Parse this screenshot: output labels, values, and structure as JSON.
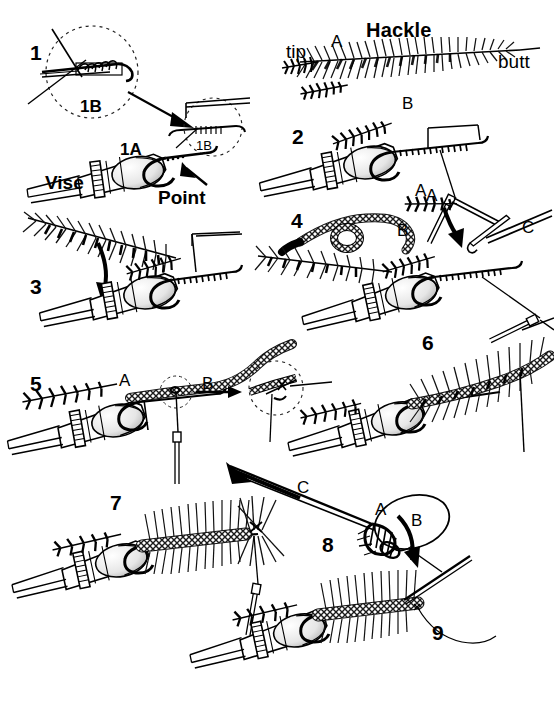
{
  "plate": {
    "title": "Fly Tying Sequence Plate",
    "width": 554,
    "height": 706,
    "background_color": "#ffffff",
    "ink_color": "#000000",
    "style": "pen-and-ink line illustration"
  },
  "steps": [
    {
      "id": "step-1",
      "number": "1",
      "x": 30,
      "y": 42
    },
    {
      "id": "step-2",
      "number": "2",
      "x": 292,
      "y": 126
    },
    {
      "id": "step-3",
      "number": "3",
      "x": 30,
      "y": 276
    },
    {
      "id": "step-4",
      "number": "4",
      "x": 291,
      "y": 210
    },
    {
      "id": "step-5",
      "number": "5",
      "x": 30,
      "y": 373
    },
    {
      "id": "step-6",
      "number": "6",
      "x": 422,
      "y": 332
    },
    {
      "id": "step-7",
      "number": "7",
      "x": 110,
      "y": 492
    },
    {
      "id": "step-8",
      "number": "8",
      "x": 322,
      "y": 534
    },
    {
      "id": "step-9",
      "number": "9",
      "x": 432,
      "y": 622
    }
  ],
  "annotations": {
    "hackle_title": {
      "text": "Hackle",
      "x": 366,
      "y": 20
    },
    "hackle_tip": {
      "text": "tip",
      "x": 286,
      "y": 42
    },
    "hackle_butt": {
      "text": "butt",
      "x": 498,
      "y": 52
    },
    "vise": {
      "text": "Vise",
      "x": 45,
      "y": 173
    },
    "point": {
      "text": "Point",
      "x": 158,
      "y": 188
    }
  },
  "sub_labels": [
    {
      "id": "label-1b-detail",
      "text": "1B",
      "x": 80,
      "y": 98,
      "kind": "step-sub"
    },
    {
      "id": "label-1a",
      "text": "1A",
      "x": 120,
      "y": 141,
      "kind": "step-sub"
    },
    {
      "id": "label-1b-inset",
      "text": "1B",
      "x": 196,
      "y": 139,
      "kind": "step-sub"
    },
    {
      "id": "label-hackle-a",
      "text": "A",
      "x": 331,
      "y": 33,
      "kind": "letter"
    },
    {
      "id": "label-2b",
      "text": "B",
      "x": 402,
      "y": 95,
      "kind": "letter"
    },
    {
      "id": "label-2a",
      "text": "A",
      "x": 415,
      "y": 182,
      "kind": "letter"
    },
    {
      "id": "label-4a",
      "text": "A",
      "x": 426,
      "y": 187,
      "kind": "letter"
    },
    {
      "id": "label-4b",
      "text": "B",
      "x": 397,
      "y": 222,
      "kind": "letter"
    },
    {
      "id": "label-4c",
      "text": "C",
      "x": 522,
      "y": 219,
      "kind": "letter"
    },
    {
      "id": "label-5a",
      "text": "A",
      "x": 119,
      "y": 372,
      "kind": "letter"
    },
    {
      "id": "label-5b",
      "text": "B",
      "x": 202,
      "y": 375,
      "kind": "letter"
    },
    {
      "id": "label-8c",
      "text": "C",
      "x": 297,
      "y": 479,
      "kind": "letter"
    },
    {
      "id": "label-8a",
      "text": "A",
      "x": 375,
      "y": 501,
      "kind": "letter"
    },
    {
      "id": "label-8b",
      "text": "B",
      "x": 411,
      "y": 512,
      "kind": "letter"
    }
  ]
}
